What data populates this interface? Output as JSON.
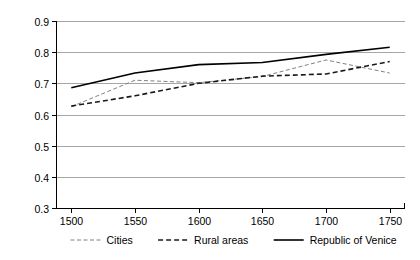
{
  "chart_data": {
    "type": "line",
    "title": "",
    "subtitle": "",
    "xlabel": "",
    "ylabel": "",
    "x": [
      1500,
      1550,
      1600,
      1650,
      1700,
      1750
    ],
    "xticklabels": [
      "1500",
      "1550",
      "1600",
      "1650",
      "1700",
      "1750"
    ],
    "yticklabels": [
      "0.3",
      "0.4",
      "0.5",
      "0.6",
      "0.7",
      "0.8",
      "0.9"
    ],
    "yticks": [
      0.3,
      0.4,
      0.5,
      0.6,
      0.7,
      0.8,
      0.9
    ],
    "xlim": [
      1488,
      1762
    ],
    "ylim": [
      0.3,
      0.9
    ],
    "grid": "horizontal",
    "legend_position": "bottom",
    "series": [
      {
        "name": "Cities",
        "values": [
          0.625,
          0.71,
          0.702,
          0.722,
          0.775,
          0.733
        ],
        "style": "dashed-light",
        "color": "#808080",
        "width": 1.0,
        "dash": "4,2.5"
      },
      {
        "name": "Rural areas",
        "values": [
          0.627,
          0.66,
          0.7,
          0.723,
          0.73,
          0.77
        ],
        "style": "dashed-bold",
        "color": "#1a1a1a",
        "width": 1.6,
        "dash": "5,3"
      },
      {
        "name": "Republic of Venice",
        "values": [
          0.686,
          0.733,
          0.76,
          0.767,
          0.793,
          0.816
        ],
        "style": "solid",
        "color": "#000000",
        "width": 1.6,
        "dash": "none"
      }
    ]
  },
  "legend": {
    "entries": [
      {
        "label": "Cities"
      },
      {
        "label": "Rural areas"
      },
      {
        "label": "Republic of Venice"
      }
    ]
  },
  "axes": {
    "y": {
      "labels": [
        "0.9",
        "0.8",
        "0.7",
        "0.6",
        "0.5",
        "0.4",
        "0.3"
      ]
    },
    "x": {
      "labels": [
        "1500",
        "1550",
        "1600",
        "1650",
        "1700",
        "1750"
      ]
    }
  }
}
